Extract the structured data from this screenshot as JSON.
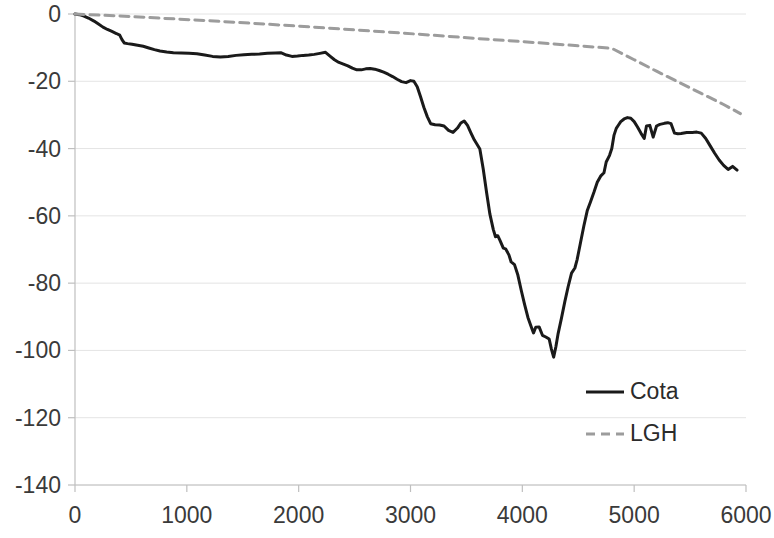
{
  "chart_data": {
    "type": "line",
    "title": "",
    "xlabel": "",
    "ylabel": "",
    "xlim": [
      0,
      6000
    ],
    "ylim": [
      -140,
      0
    ],
    "x_ticks": [
      0,
      1000,
      2000,
      3000,
      4000,
      5000,
      6000
    ],
    "y_ticks": [
      0,
      -20,
      -40,
      -60,
      -80,
      -100,
      -120,
      -140
    ],
    "x_tick_labels": [
      "0",
      "1000",
      "2000",
      "3000",
      "4000",
      "5000",
      "6000"
    ],
    "y_tick_labels": [
      "0",
      "-20",
      "-40",
      "-60",
      "-80",
      "-100",
      "-120",
      "-140"
    ],
    "grid": "horizontal",
    "legend_position": "inside-lower-right",
    "series": [
      {
        "name": "Cota",
        "style": "solid",
        "color": "#1a1a1a",
        "width": 3,
        "points": [
          [
            0,
            0
          ],
          [
            40,
            -0.2
          ],
          [
            80,
            -0.6
          ],
          [
            120,
            -1.2
          ],
          [
            170,
            -2.1
          ],
          [
            210,
            -3.0
          ],
          [
            250,
            -3.9
          ],
          [
            290,
            -4.6
          ],
          [
            330,
            -5.2
          ],
          [
            370,
            -5.8
          ],
          [
            400,
            -6.3
          ],
          [
            420,
            -7.6
          ],
          [
            440,
            -8.6
          ],
          [
            470,
            -8.8
          ],
          [
            510,
            -9.0
          ],
          [
            560,
            -9.3
          ],
          [
            610,
            -9.6
          ],
          [
            660,
            -10.1
          ],
          [
            710,
            -10.6
          ],
          [
            760,
            -11.0
          ],
          [
            820,
            -11.3
          ],
          [
            880,
            -11.5
          ],
          [
            950,
            -11.6
          ],
          [
            1020,
            -11.7
          ],
          [
            1090,
            -11.8
          ],
          [
            1160,
            -12.2
          ],
          [
            1230,
            -12.6
          ],
          [
            1300,
            -12.8
          ],
          [
            1370,
            -12.6
          ],
          [
            1440,
            -12.3
          ],
          [
            1510,
            -12.1
          ],
          [
            1580,
            -12.0
          ],
          [
            1650,
            -11.9
          ],
          [
            1720,
            -11.7
          ],
          [
            1790,
            -11.6
          ],
          [
            1840,
            -11.5
          ],
          [
            1890,
            -12.2
          ],
          [
            1940,
            -12.6
          ],
          [
            1990,
            -12.5
          ],
          [
            2040,
            -12.3
          ],
          [
            2090,
            -12.2
          ],
          [
            2140,
            -12.0
          ],
          [
            2190,
            -11.7
          ],
          [
            2240,
            -11.4
          ],
          [
            2280,
            -12.5
          ],
          [
            2320,
            -13.6
          ],
          [
            2360,
            -14.4
          ],
          [
            2400,
            -14.9
          ],
          [
            2440,
            -15.4
          ],
          [
            2480,
            -16.1
          ],
          [
            2520,
            -16.6
          ],
          [
            2560,
            -16.6
          ],
          [
            2600,
            -16.3
          ],
          [
            2640,
            -16.2
          ],
          [
            2680,
            -16.4
          ],
          [
            2720,
            -16.8
          ],
          [
            2760,
            -17.3
          ],
          [
            2800,
            -17.9
          ],
          [
            2840,
            -18.6
          ],
          [
            2880,
            -19.4
          ],
          [
            2920,
            -20.1
          ],
          [
            2960,
            -20.4
          ],
          [
            3000,
            -19.8
          ],
          [
            3030,
            -20.0
          ],
          [
            3060,
            -21.6
          ],
          [
            3090,
            -24.6
          ],
          [
            3120,
            -27.8
          ],
          [
            3150,
            -30.5
          ],
          [
            3180,
            -32.6
          ],
          [
            3220,
            -32.9
          ],
          [
            3260,
            -33.0
          ],
          [
            3300,
            -33.3
          ],
          [
            3340,
            -34.6
          ],
          [
            3380,
            -35.2
          ],
          [
            3420,
            -33.9
          ],
          [
            3450,
            -32.4
          ],
          [
            3480,
            -31.8
          ],
          [
            3510,
            -33.1
          ],
          [
            3540,
            -35.3
          ],
          [
            3570,
            -37.4
          ],
          [
            3600,
            -39.0
          ],
          [
            3620,
            -40.1
          ],
          [
            3650,
            -46.0
          ],
          [
            3680,
            -53.0
          ],
          [
            3710,
            -59.5
          ],
          [
            3740,
            -64.0
          ],
          [
            3760,
            -66.2
          ],
          [
            3780,
            -65.9
          ],
          [
            3800,
            -67.3
          ],
          [
            3830,
            -69.6
          ],
          [
            3850,
            -69.8
          ],
          [
            3880,
            -71.6
          ],
          [
            3900,
            -73.7
          ],
          [
            3930,
            -74.5
          ],
          [
            3960,
            -77.6
          ],
          [
            3990,
            -82.1
          ],
          [
            4020,
            -86.3
          ],
          [
            4050,
            -90.2
          ],
          [
            4080,
            -93.0
          ],
          [
            4100,
            -94.8
          ],
          [
            4120,
            -93.1
          ],
          [
            4150,
            -93.0
          ],
          [
            4180,
            -95.5
          ],
          [
            4210,
            -96.0
          ],
          [
            4240,
            -96.6
          ],
          [
            4260,
            -99.6
          ],
          [
            4280,
            -102.0
          ],
          [
            4300,
            -98.9
          ],
          [
            4320,
            -95.0
          ],
          [
            4350,
            -90.4
          ],
          [
            4380,
            -85.5
          ],
          [
            4410,
            -81.0
          ],
          [
            4440,
            -77.0
          ],
          [
            4470,
            -75.5
          ],
          [
            4490,
            -73.0
          ],
          [
            4520,
            -68.0
          ],
          [
            4550,
            -63.0
          ],
          [
            4580,
            -58.5
          ],
          [
            4610,
            -55.8
          ],
          [
            4640,
            -53.0
          ],
          [
            4670,
            -50.0
          ],
          [
            4700,
            -48.2
          ],
          [
            4730,
            -47.2
          ],
          [
            4750,
            -44.0
          ],
          [
            4780,
            -42.0
          ],
          [
            4800,
            -40.0
          ],
          [
            4820,
            -36.0
          ],
          [
            4840,
            -34.0
          ],
          [
            4860,
            -33.0
          ],
          [
            4880,
            -32.0
          ],
          [
            4910,
            -31.2
          ],
          [
            4940,
            -30.8
          ],
          [
            4970,
            -31.0
          ],
          [
            5000,
            -32.0
          ],
          [
            5030,
            -33.6
          ],
          [
            5060,
            -35.4
          ],
          [
            5090,
            -37.0
          ],
          [
            5110,
            -33.3
          ],
          [
            5140,
            -33.1
          ],
          [
            5170,
            -36.6
          ],
          [
            5200,
            -33.3
          ],
          [
            5230,
            -32.8
          ],
          [
            5270,
            -32.5
          ],
          [
            5300,
            -32.3
          ],
          [
            5330,
            -32.6
          ],
          [
            5360,
            -35.4
          ],
          [
            5390,
            -35.6
          ],
          [
            5420,
            -35.5
          ],
          [
            5470,
            -35.2
          ],
          [
            5520,
            -35.2
          ],
          [
            5560,
            -35.1
          ],
          [
            5600,
            -35.4
          ],
          [
            5640,
            -37.0
          ],
          [
            5680,
            -39.2
          ],
          [
            5720,
            -41.4
          ],
          [
            5760,
            -43.4
          ],
          [
            5800,
            -45.0
          ],
          [
            5840,
            -46.2
          ],
          [
            5880,
            -45.3
          ],
          [
            5920,
            -46.4
          ]
        ]
      },
      {
        "name": "LGH",
        "style": "dashed",
        "color": "#9c9c9c",
        "width": 3,
        "points": [
          [
            0,
            0
          ],
          [
            400,
            -0.6
          ],
          [
            800,
            -1.3
          ],
          [
            1200,
            -2.0
          ],
          [
            1600,
            -2.8
          ],
          [
            2000,
            -3.6
          ],
          [
            2400,
            -4.5
          ],
          [
            2800,
            -5.4
          ],
          [
            3200,
            -6.3
          ],
          [
            3600,
            -7.3
          ],
          [
            4000,
            -8.2
          ],
          [
            4400,
            -9.2
          ],
          [
            4800,
            -10.2
          ],
          [
            5000,
            -13.6
          ],
          [
            5200,
            -17.0
          ],
          [
            5400,
            -20.3
          ],
          [
            5600,
            -23.6
          ],
          [
            5800,
            -26.9
          ],
          [
            5950,
            -29.6
          ]
        ]
      }
    ]
  },
  "legend": {
    "entries": [
      {
        "label": "Cota",
        "style": "solid",
        "color": "#1a1a1a"
      },
      {
        "label": "LGH",
        "style": "dashed",
        "color": "#9c9c9c"
      }
    ]
  },
  "axes": {
    "axis_color": "#bfbfbf",
    "grid_color": "#e4e4e4",
    "tick_text_color": "#3a3a3a"
  }
}
